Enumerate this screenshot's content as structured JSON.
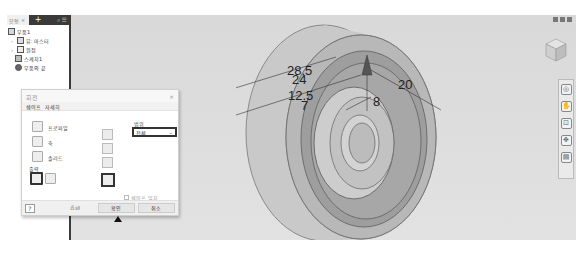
{
  "browser": {
    "tab_label": "모형",
    "tab_close": "×",
    "add_label": "+",
    "tools_label": "⌕ ☰",
    "tree": [
      {
        "label": "부품1",
        "icon": "part-icon",
        "level": 0,
        "expander": ""
      },
      {
        "label": "뷰: 마스터",
        "icon": "view-icon",
        "level": 1,
        "expander": "›"
      },
      {
        "label": "원점",
        "icon": "origin-folder-icon",
        "level": 1,
        "expander": "›"
      },
      {
        "label": "스케치1",
        "icon": "sketch-icon",
        "level": 1,
        "expander": ""
      },
      {
        "label": "부품의 끝",
        "icon": "end-of-part-icon",
        "level": 1,
        "expander": ""
      }
    ]
  },
  "viewport": {
    "dimensions": [
      "28.5",
      "24",
      "12.5",
      "7",
      "8",
      "20"
    ],
    "nav_bar": [
      "steering-wheel-icon",
      "pan-icon",
      "zoom-icon",
      "orbit-icon",
      "look-at-icon"
    ]
  },
  "dialog": {
    "title": "회전",
    "close": "×",
    "tabs": [
      "쉐이프",
      "자세히"
    ],
    "profile_label": "프로파일",
    "axis_label": "축",
    "solid_label": "솔리드",
    "output_label": "출력",
    "extents_label": "범위",
    "extents_value": "전체",
    "match_shape_label": "쉐이프 일치",
    "expr_label": "δ𝑥∂",
    "ok_label": "확인",
    "cancel_label": "취소"
  }
}
